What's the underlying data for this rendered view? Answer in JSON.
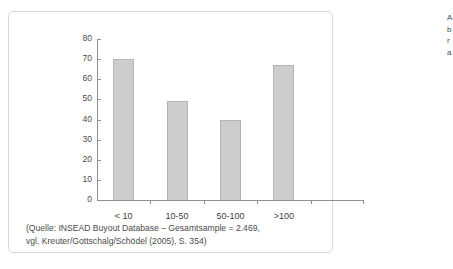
{
  "figure": {
    "source_caption_line1": "(Quelle: INSEAD Buyout Database – Gesamtsample = 2.469,",
    "source_caption_line2": "vgl. Kreuter/Gottschalg/Schödel (2005), S. 354)"
  },
  "margin_text": {
    "lines": [
      "A",
      "b",
      "r",
      "a"
    ]
  },
  "chart_data": {
    "type": "bar",
    "title": "",
    "xlabel": "",
    "ylabel": "",
    "categories": [
      "< 10",
      "10-50",
      "50-100",
      ">100"
    ],
    "values": [
      70,
      49,
      40,
      67
    ],
    "ylim": [
      0,
      80
    ],
    "yticks": [
      0,
      10,
      20,
      30,
      40,
      50,
      60,
      70,
      80
    ],
    "ytick_labels": [
      "0",
      "10",
      "20",
      "30",
      "40",
      "50",
      "60",
      "70",
      "80"
    ],
    "grid": false,
    "legend": null,
    "bar_fill_color": "#cdcdcd",
    "bar_border_color": "#b4b4b4",
    "axis_color": "#8f8f8f"
  }
}
